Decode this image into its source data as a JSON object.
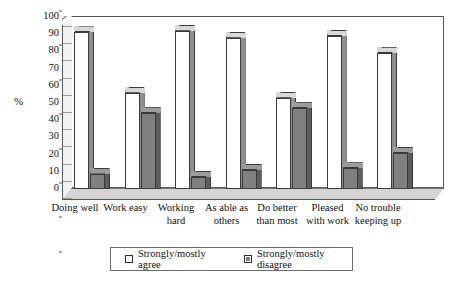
{
  "chart_data": {
    "type": "bar",
    "title": "",
    "subtitle": "",
    "xlabel": "",
    "ylabel": "%",
    "ylim": [
      0,
      100
    ],
    "ytick_step": 10,
    "yticks": [
      100,
      90,
      80,
      70,
      60,
      50,
      40,
      30,
      20,
      10,
      0
    ],
    "grid": false,
    "legend_position": "bottom",
    "style": "3d-clustered-column",
    "categories": [
      "Doing well",
      "Work easy",
      "Working\nhard",
      "As able as\nothers",
      "Do better\nthan most",
      "Pleased\nwith work",
      "No trouble\nkeeping up"
    ],
    "series": [
      {
        "name": "Strongly/mostly agree",
        "color": "#ffffff",
        "values": [
          91,
          56,
          92,
          88,
          53,
          89,
          79
        ]
      },
      {
        "name": "Strongly/mostly disagree",
        "color": "#808080",
        "values": [
          9,
          44,
          7,
          11,
          47,
          12,
          21
        ]
      }
    ]
  },
  "axis": {
    "y_title": "%"
  },
  "legend": {
    "items": [
      {
        "label": "Strongly/mostly agree",
        "swatch": "agree"
      },
      {
        "label": "Strongly/mostly disagree",
        "swatch": "disagree"
      }
    ]
  },
  "colors": {
    "agree_fill": "#ffffff",
    "disagree_fill": "#808080",
    "bar_outline": "#3a3a3a",
    "floor": "#d4d4d4",
    "wall": "#ffffff",
    "axis_line": "#5a5a5a"
  }
}
